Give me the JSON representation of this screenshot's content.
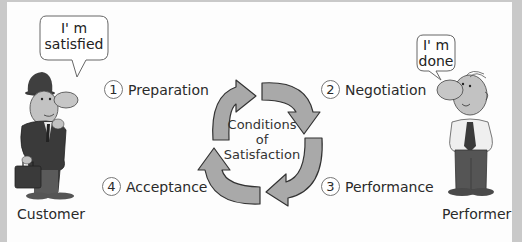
{
  "diagram": {
    "center_label": [
      "Conditions",
      "of",
      "Satisfaction"
    ],
    "steps": [
      {
        "number": "1",
        "label": "Preparation"
      },
      {
        "number": "2",
        "label": "Negotiation"
      },
      {
        "number": "3",
        "label": "Performance"
      },
      {
        "number": "4",
        "label": "Acceptance"
      }
    ],
    "actors": {
      "customer": {
        "role": "Customer",
        "speech": [
          "I' m",
          "satisfied"
        ]
      },
      "performer": {
        "role": "Performer",
        "speech": [
          "I' m",
          "done"
        ]
      }
    },
    "colors": {
      "arrow_fill": "#a9a9a9",
      "arrow_stroke": "#333333",
      "frame": "#c9c9c9",
      "background": "#fdfdfd"
    }
  }
}
